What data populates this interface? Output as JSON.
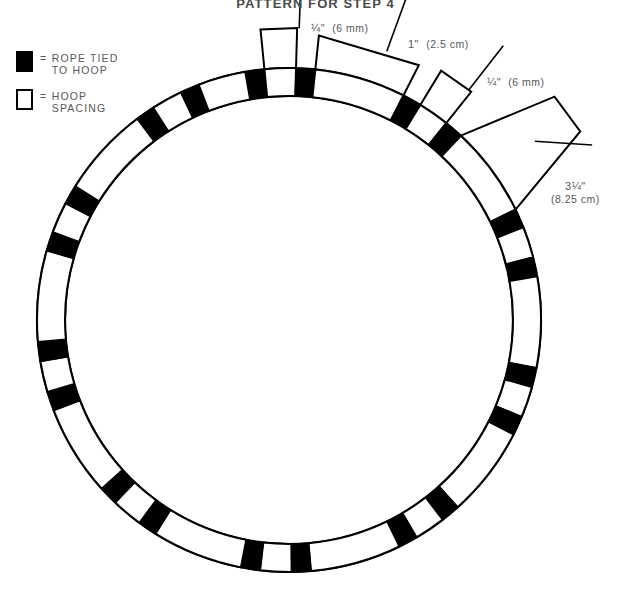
{
  "title": "PATTERN FOR STEP 4",
  "legend": {
    "items": [
      {
        "swatch": "filled",
        "eq": "=",
        "label": "ROPE TIED\nTO HOOP"
      },
      {
        "swatch": "hollow",
        "eq": "=",
        "label": "HOOP\nSPACING"
      }
    ]
  },
  "callouts": [
    {
      "name": "rope-width-top",
      "imperial": "¼\"",
      "metric": "(6 mm)",
      "label_x": 311,
      "label_y": 22,
      "stacked": false
    },
    {
      "name": "hoop-spacing-top",
      "imperial": "1\"",
      "metric": "(2.5 cm)",
      "label_x": 408,
      "label_y": 38,
      "stacked": false
    },
    {
      "name": "rope-width-right",
      "imperial": "¼\"",
      "metric": "(6 mm)",
      "label_x": 487,
      "label_y": 76,
      "stacked": false
    },
    {
      "name": "hoop-spacing-right",
      "imperial": "3¼\"",
      "metric": "(8.25 cm)",
      "label_x": 551,
      "label_y": 180,
      "stacked": true
    }
  ],
  "ring": {
    "center_x": 289,
    "center_y": 320,
    "outer_radius": 252,
    "inner_radius": 224,
    "stroke_color": "#000000",
    "fill_color": "#000000",
    "background": "#ffffff",
    "segments": [
      {
        "start": -100.0,
        "end": -95.6,
        "kind": "rope"
      },
      {
        "start": -95.6,
        "end": -88.4,
        "kind": "spacing"
      },
      {
        "start": -88.4,
        "end": -84.0,
        "kind": "rope"
      },
      {
        "start": -84.0,
        "end": -63.0,
        "kind": "spacing"
      },
      {
        "start": -63.0,
        "end": -58.6,
        "kind": "rope"
      },
      {
        "start": -58.6,
        "end": -51.4,
        "kind": "spacing"
      },
      {
        "start": -51.4,
        "end": -47.0,
        "kind": "rope"
      },
      {
        "start": -47.0,
        "end": -26.0,
        "kind": "spacing"
      },
      {
        "start": -26.0,
        "end": -21.6,
        "kind": "rope"
      },
      {
        "start": -21.6,
        "end": -14.4,
        "kind": "spacing"
      },
      {
        "start": -14.4,
        "end": -10.0,
        "kind": "rope"
      },
      {
        "start": -10.0,
        "end": 11.0,
        "kind": "spacing"
      },
      {
        "start": 11.0,
        "end": 15.4,
        "kind": "rope"
      },
      {
        "start": 15.4,
        "end": 22.6,
        "kind": "spacing"
      },
      {
        "start": 22.6,
        "end": 27.0,
        "kind": "rope"
      },
      {
        "start": 27.0,
        "end": 48.0,
        "kind": "spacing"
      },
      {
        "start": 48.0,
        "end": 52.4,
        "kind": "rope"
      },
      {
        "start": 52.4,
        "end": 59.6,
        "kind": "spacing"
      },
      {
        "start": 59.6,
        "end": 64.0,
        "kind": "rope"
      },
      {
        "start": 64.0,
        "end": 85.0,
        "kind": "spacing"
      },
      {
        "start": 85.0,
        "end": 89.4,
        "kind": "rope"
      },
      {
        "start": 89.4,
        "end": 96.6,
        "kind": "spacing"
      },
      {
        "start": 96.6,
        "end": 101.0,
        "kind": "rope"
      },
      {
        "start": 101.0,
        "end": 122.0,
        "kind": "spacing"
      },
      {
        "start": 122.0,
        "end": 126.4,
        "kind": "rope"
      },
      {
        "start": 126.4,
        "end": 133.6,
        "kind": "spacing"
      },
      {
        "start": 133.6,
        "end": 138.0,
        "kind": "rope"
      },
      {
        "start": 138.0,
        "end": 159.0,
        "kind": "spacing"
      },
      {
        "start": 159.0,
        "end": 163.4,
        "kind": "rope"
      },
      {
        "start": 163.4,
        "end": 170.6,
        "kind": "spacing"
      },
      {
        "start": 170.6,
        "end": 175.0,
        "kind": "rope"
      },
      {
        "start": 175.0,
        "end": 196.0,
        "kind": "spacing"
      },
      {
        "start": 196.0,
        "end": 200.4,
        "kind": "rope"
      },
      {
        "start": 200.4,
        "end": 207.6,
        "kind": "spacing"
      },
      {
        "start": 207.6,
        "end": 212.0,
        "kind": "rope"
      },
      {
        "start": 212.0,
        "end": 233.0,
        "kind": "spacing"
      },
      {
        "start": 233.0,
        "end": 237.4,
        "kind": "rope"
      },
      {
        "start": 237.4,
        "end": 244.6,
        "kind": "spacing"
      },
      {
        "start": 244.6,
        "end": 249.0,
        "kind": "rope"
      },
      {
        "start": 249.0,
        "end": 260.0,
        "kind": "spacing"
      }
    ],
    "leaders": [
      {
        "name": "callout-box-rope-top",
        "shape": "box",
        "angle_start": -95.6,
        "angle_end": -88.4,
        "outer_offset": 40,
        "tick_angle": -88.0,
        "tick_length": 58
      },
      {
        "name": "callout-box-spacing-top",
        "shape": "box",
        "angle_start": -84.0,
        "angle_end": -63.0,
        "outer_offset": 34,
        "tick_angle": -70.0,
        "tick_length": 56
      },
      {
        "name": "callout-box-rope-right",
        "shape": "box",
        "angle_start": -58.6,
        "angle_end": -51.4,
        "outer_offset": 40,
        "tick_angle": -52.0,
        "tick_length": 56
      },
      {
        "name": "callout-box-spacing-right",
        "shape": "wedge",
        "angle_start": -47.0,
        "angle_end": -26.0,
        "outer_offset": 95,
        "tick_angle": -33.0,
        "tick_length": 0
      }
    ]
  }
}
